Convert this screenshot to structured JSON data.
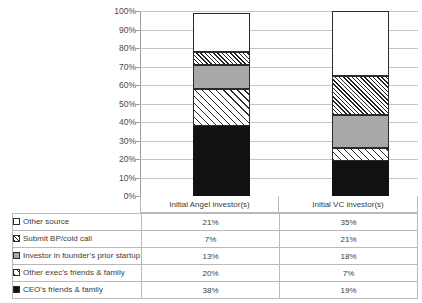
{
  "chart_data": {
    "type": "bar",
    "subtype": "stacked-100-percent-column",
    "title": "",
    "xlabel": "",
    "ylabel": "",
    "ylim": [
      0,
      100
    ],
    "y_tick_labels": [
      "100%",
      "90%",
      "80%",
      "70%",
      "60%",
      "50%",
      "40%",
      "30%",
      "20%",
      "10%",
      "0%"
    ],
    "y_tick_values": [
      100,
      90,
      80,
      70,
      60,
      50,
      40,
      30,
      20,
      10,
      0
    ],
    "grid": true,
    "legend_position": "table-left-column",
    "categories": [
      "Initial Angel investor(s)",
      "Initial VC investor(s)"
    ],
    "series": [
      {
        "name": "Other source",
        "values": [
          21,
          35
        ],
        "labels": [
          "21%",
          "35%"
        ],
        "swatch": "open-square-white-icon",
        "fill": "white",
        "color": "#ffffff"
      },
      {
        "name": "Submit BP/cold call",
        "values": [
          7,
          21
        ],
        "labels": [
          "7%",
          "21%"
        ],
        "swatch": "dense-diagonal-hatch-icon",
        "fill": "hatch-dense",
        "color": "#222222"
      },
      {
        "name": "Investor in founder’s prior startup",
        "values": [
          13,
          18
        ],
        "labels": [
          "13%",
          "18%"
        ],
        "swatch": "solid-gray-square-icon",
        "fill": "gray",
        "color": "#a8a8a8"
      },
      {
        "name": "Other exec’s friends & family",
        "values": [
          20,
          7
        ],
        "labels": [
          "20%",
          "7%"
        ],
        "swatch": "wide-diagonal-hatch-icon",
        "fill": "hatch-wide",
        "color": "#2a2a2a"
      },
      {
        "name": "CEO’s friends & family",
        "values": [
          38,
          19
        ],
        "labels": [
          "38%",
          "19%"
        ],
        "swatch": "solid-black-square-icon",
        "fill": "black",
        "color": "#111111"
      }
    ],
    "stack_order_bottom_to_top": [
      "CEO’s friends & family",
      "Other exec’s friends & family",
      "Investor in founder’s prior startup",
      "Submit BP/cold call",
      "Other source"
    ],
    "colors": {
      "grid": "#c4c4c4",
      "axis": "#9a9a9a",
      "table_border": "#b9b9b9",
      "text": "#3c3c3c",
      "segment_outline": "#2b2b2b"
    }
  }
}
